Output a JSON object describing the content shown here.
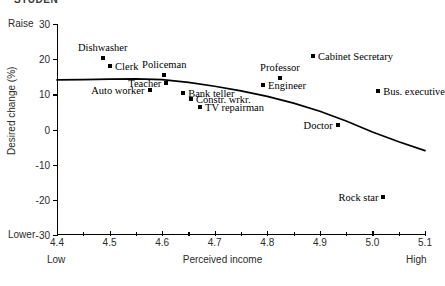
{
  "clipped_title": "STUDEN",
  "chart_data": {
    "type": "scatter",
    "title": "",
    "xlabel": "Perceived income",
    "ylabel": "Desired change (%)",
    "xlim": [
      4.4,
      5.1
    ],
    "ylim": [
      -30,
      30
    ],
    "xticks": [
      "4.4",
      "4.5",
      "4.6",
      "4.7",
      "4.8",
      "4.9",
      "5.0",
      "5.1"
    ],
    "xtick_values": [
      4.4,
      4.5,
      4.6,
      4.7,
      4.8,
      4.9,
      5.0,
      5.1
    ],
    "yticks": [
      "30",
      "20",
      "10",
      "0",
      "-10",
      "-20",
      "-30"
    ],
    "ytick_values": [
      30,
      20,
      10,
      0,
      -10,
      -20,
      -30
    ],
    "grid": false,
    "legend": false,
    "axis_end_labels": {
      "y_high": "Raise",
      "y_low": "Lower",
      "x_low": "Low",
      "x_high": "High"
    },
    "points": [
      {
        "label": "Dishwasher",
        "x": 4.487,
        "y": 20.2,
        "label_pos": "above"
      },
      {
        "label": "Clerk",
        "x": 4.501,
        "y": 18.1,
        "label_pos": "right"
      },
      {
        "label": "Policeman",
        "x": 4.604,
        "y": 15.4,
        "label_pos": "above"
      },
      {
        "label": "Teacher",
        "x": 4.608,
        "y": 13.2,
        "label_pos": "left"
      },
      {
        "label": "Auto worker",
        "x": 4.576,
        "y": 11.1,
        "label_pos": "left"
      },
      {
        "label": "Bank teller",
        "x": 4.64,
        "y": 10.4,
        "label_pos": "right"
      },
      {
        "label": "Constr. wrkr.",
        "x": 4.655,
        "y": 8.8,
        "label_pos": "right"
      },
      {
        "label": "TV repairman",
        "x": 4.672,
        "y": 6.5,
        "label_pos": "right"
      },
      {
        "label": "Engineer",
        "x": 4.792,
        "y": 12.6,
        "label_pos": "right"
      },
      {
        "label": "Professor",
        "x": 4.824,
        "y": 14.6,
        "label_pos": "above"
      },
      {
        "label": "Cabinet Secretary",
        "x": 4.887,
        "y": 20.9,
        "label_pos": "right"
      },
      {
        "label": "Bus. executive",
        "x": 5.011,
        "y": 11.0,
        "label_pos": "right"
      },
      {
        "label": "Doctor",
        "x": 4.934,
        "y": 1.4,
        "label_pos": "left"
      },
      {
        "label": "Rock star",
        "x": 5.021,
        "y": -19.2,
        "label_pos": "left"
      }
    ],
    "trend_line": {
      "name": "fitted curve",
      "x": [
        4.4,
        4.45,
        4.5,
        4.55,
        4.6,
        4.65,
        4.7,
        4.75,
        4.8,
        4.85,
        4.9,
        4.95,
        5.0,
        5.05,
        5.1
      ],
      "y": [
        14.1,
        14.2,
        14.3,
        14.4,
        14.2,
        13.4,
        12.3,
        11.0,
        9.4,
        7.5,
        5.2,
        2.4,
        -0.7,
        -3.5,
        -6.0
      ]
    }
  }
}
